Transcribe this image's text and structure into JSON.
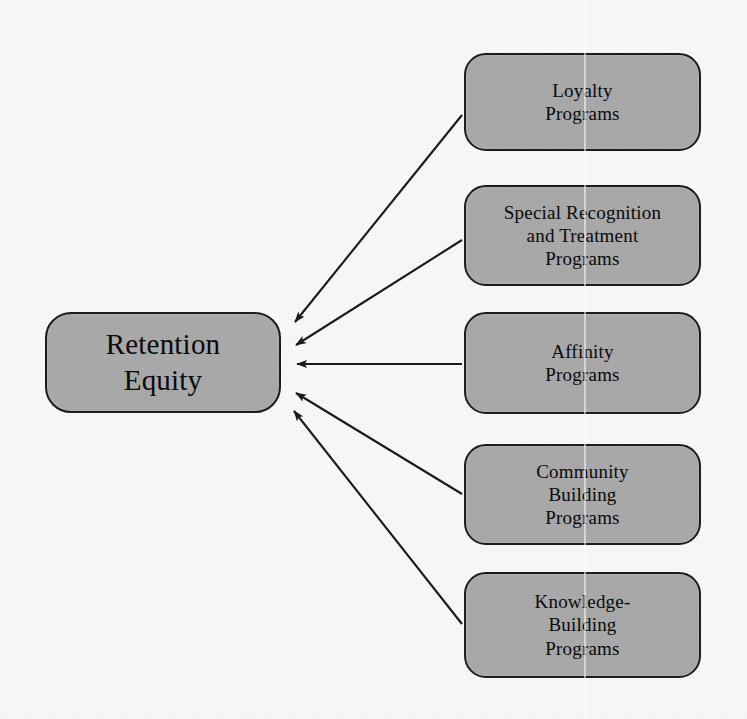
{
  "diagram": {
    "type": "radial-convergence",
    "background_color": "#f9f8f6",
    "node_fill_color": "#a9a9a9",
    "node_border_color": "#1c1c1c",
    "text_color": "#0a0a0a",
    "arrow_color": "#1a1a1a",
    "center_node": {
      "id": "retention-equity",
      "lines": [
        "Retention",
        "Equity"
      ],
      "text": "Retention Equity"
    },
    "driver_nodes": [
      {
        "id": "loyalty-programs",
        "lines": [
          "Loyalty",
          "Programs"
        ],
        "text": "Loyalty Programs"
      },
      {
        "id": "special-recognition-and-treatment-programs",
        "lines": [
          "Special Recognition",
          "and Treatment",
          "Programs"
        ],
        "text": "Special Recognition and Treatment Programs"
      },
      {
        "id": "affinity-programs",
        "lines": [
          "Affinity",
          "Programs"
        ],
        "text": "Affinity Programs"
      },
      {
        "id": "community-building-programs",
        "lines": [
          "Community",
          "Building",
          "Programs"
        ],
        "text": "Community Building Programs"
      },
      {
        "id": "knowledge-building-programs",
        "lines": [
          "Knowledge-",
          "Building",
          "Programs"
        ],
        "text": "Knowledge-Building Programs"
      }
    ],
    "edges": [
      {
        "from": "loyalty-programs",
        "to": "retention-equity",
        "direction": "arrow"
      },
      {
        "from": "special-recognition-and-treatment-programs",
        "to": "retention-equity",
        "direction": "arrow"
      },
      {
        "from": "affinity-programs",
        "to": "retention-equity",
        "direction": "arrow"
      },
      {
        "from": "community-building-programs",
        "to": "retention-equity",
        "direction": "arrow"
      },
      {
        "from": "knowledge-building-programs",
        "to": "retention-equity",
        "direction": "arrow"
      }
    ]
  }
}
